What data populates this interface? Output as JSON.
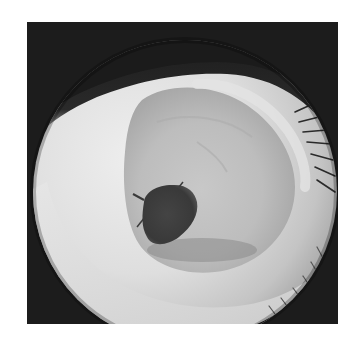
{
  "image": {
    "description": "Grayscale close-up photograph of an eye viewed through a circular lens",
    "frame_color": "#1c1c1c",
    "background_color": "#ffffff",
    "sclera_color": "#dcdcdc",
    "iris_color": "#b8b8b8",
    "pupil_color": "#3a3a3a"
  }
}
